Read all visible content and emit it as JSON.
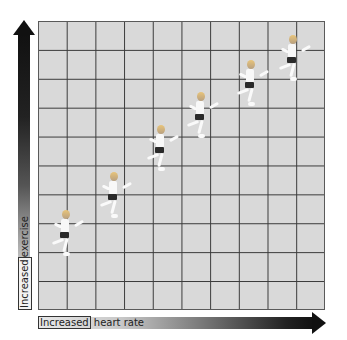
{
  "diagram": {
    "title": "",
    "y_axis": {
      "label_part1": "Increased",
      "label_part2": " exercise"
    },
    "x_axis": {
      "label_part1": "Increased",
      "label_part2": " heart rate"
    },
    "grid": {
      "columns": 10,
      "rows": 10
    },
    "runners": [
      {
        "id": 1,
        "x": 60,
        "y": 210
      },
      {
        "id": 2,
        "x": 108,
        "y": 172
      },
      {
        "id": 3,
        "x": 155,
        "y": 125
      },
      {
        "id": 4,
        "x": 195,
        "y": 92
      },
      {
        "id": 5,
        "x": 245,
        "y": 60
      },
      {
        "id": 6,
        "x": 287,
        "y": 35
      }
    ],
    "colors": {
      "grid_bg": "#d9d9d9",
      "grid_line": "#3a3a3a",
      "arrow_dark": "#111111",
      "arrow_light": "#e0e0e0"
    }
  }
}
